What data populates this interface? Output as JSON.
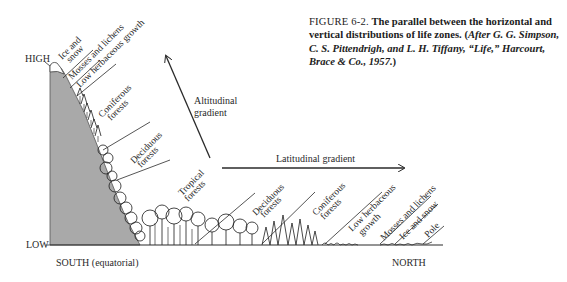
{
  "caption": {
    "figure_label": "FIGURE 6-2.",
    "title_text": "The parallel between the horizontal and vertical distributions of life zones.",
    "citation_open": "(",
    "citation_italic": "After G. G. Simpson, C. S. Pittendrigh, and L. H. Tiffany, “Life,” Harcourt, Brace & Co., 1957.",
    "citation_close": ")"
  },
  "axes": {
    "high_label": "HIGH",
    "low_label": "LOW",
    "south_label": "SOUTH (equatorial)",
    "north_label": "NORTH"
  },
  "gradients": {
    "altitudinal_line1": "Altitudinal",
    "altitudinal_line2": "gradient",
    "latitudinal": "Latitudinal gradient"
  },
  "altitudinal_zones": [
    {
      "line1": "Ice and",
      "line2": "snow"
    },
    {
      "line1": "Mosses and lichens",
      "line2": ""
    },
    {
      "line1": "Low herbaceous growth",
      "line2": ""
    },
    {
      "line1": "Coniferous",
      "line2": "forests"
    },
    {
      "line1": "Deciduous",
      "line2": "forests"
    },
    {
      "line1": "Tropical",
      "line2": "forests"
    }
  ],
  "latitudinal_zones": [
    {
      "line1": "Deciduous",
      "line2": "forests"
    },
    {
      "line1": "Coniferous",
      "line2": "forests"
    },
    {
      "line1": "Low herbaceous",
      "line2": "growth"
    },
    {
      "line1": "Mosses and lichens",
      "line2": ""
    },
    {
      "line1": "Ice and snow",
      "line2": ""
    },
    {
      "line1": "Pole",
      "line2": ""
    }
  ],
  "colors": {
    "mountain_fill": "#a9a9a9",
    "ink": "#2a2a2a",
    "background": "#ffffff"
  }
}
